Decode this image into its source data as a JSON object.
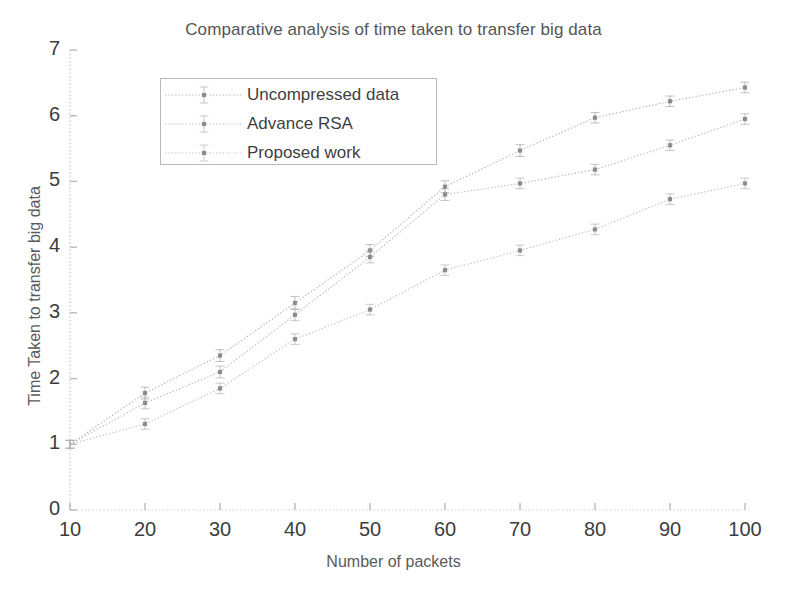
{
  "chart_data": {
    "type": "line",
    "title": "Comparative analysis of time taken to transfer big data",
    "xlabel": "Number of packets",
    "ylabel": "Time Taken to transfer big data",
    "x": [
      10,
      20,
      30,
      40,
      50,
      60,
      70,
      80,
      90,
      100
    ],
    "xticks": [
      "10",
      "20",
      "30",
      "40",
      "50",
      "60",
      "70",
      "80",
      "90",
      "100"
    ],
    "yticks": [
      "0",
      "1",
      "2",
      "3",
      "4",
      "5",
      "6",
      "7"
    ],
    "xlim": [
      10,
      100
    ],
    "ylim": [
      0,
      7
    ],
    "grid": false,
    "legend_position": "upper left",
    "errorbars": true,
    "series": [
      {
        "name": "Uncompressed data",
        "color": "#9a9a9a",
        "values": [
          1.0,
          1.78,
          2.35,
          3.15,
          3.95,
          4.92,
          5.47,
          5.97,
          6.22,
          6.43
        ],
        "errors": [
          0.06,
          0.09,
          0.09,
          0.1,
          0.09,
          0.09,
          0.09,
          0.08,
          0.08,
          0.08
        ]
      },
      {
        "name": "Advance RSA",
        "color": "#a3a3a3",
        "values": [
          1.0,
          1.63,
          2.1,
          2.97,
          3.85,
          4.8,
          4.97,
          5.18,
          5.55,
          5.95
        ],
        "errors": [
          0.06,
          0.09,
          0.09,
          0.09,
          0.09,
          0.09,
          0.08,
          0.08,
          0.08,
          0.08
        ]
      },
      {
        "name": "Proposed work",
        "color": "#ababab",
        "values": [
          1.0,
          1.31,
          1.85,
          2.6,
          3.05,
          3.65,
          3.95,
          4.27,
          4.73,
          4.97
        ],
        "errors": [
          0.06,
          0.08,
          0.08,
          0.08,
          0.08,
          0.08,
          0.08,
          0.08,
          0.08,
          0.08
        ]
      }
    ]
  },
  "axes": {
    "axis_color": "#cfcfcf",
    "tick_color": "#b5b5b5",
    "label_color": "#3d3d3d"
  }
}
